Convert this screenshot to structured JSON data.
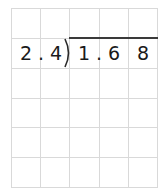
{
  "problem": {
    "divisor": {
      "d1": "2",
      "dot": ".",
      "d2": "4"
    },
    "dividend": {
      "d1": "1",
      "dot": ".",
      "d2": "6",
      "d3": "8"
    }
  },
  "grid": {
    "columns": 5,
    "rows": 6,
    "line_color": "#d9d9d9"
  }
}
